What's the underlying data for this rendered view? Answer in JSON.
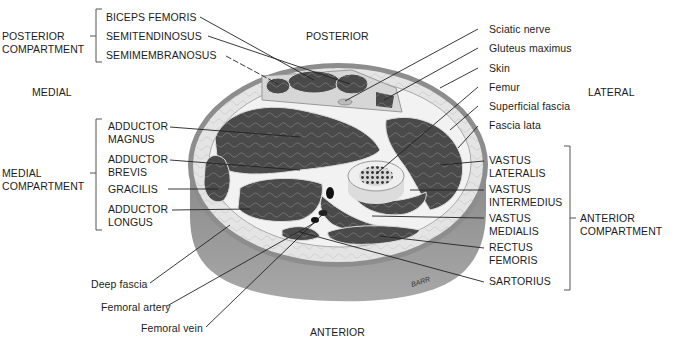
{
  "figure": {
    "orientation": {
      "posterior": "POSTERIOR",
      "anterior": "ANTERIOR",
      "medial": "MEDIAL",
      "lateral": "LATERAL"
    },
    "compartments": {
      "posterior": {
        "label": "POSTERIOR\nCOMPARTMENT",
        "muscles": [
          "BICEPS FEMORIS",
          "SEMITENDINOSUS",
          "SEMIMEMBRANOSUS"
        ]
      },
      "medial": {
        "label": "MEDIAL\nCOMPARTMENT",
        "muscles": [
          "ADDUCTOR\nMAGNUS",
          "ADDUCTOR\nBREVIS",
          "GRACILIS",
          "ADDUCTOR\nLONGUS"
        ]
      },
      "anterior": {
        "label": "ANTERIOR\nCOMPARTMENT",
        "muscles": [
          "VASTUS\nLATERALIS",
          "VASTUS\nINTERMEDIUS",
          "VASTUS\nMEDIALIS",
          "RECTUS\nFEMORIS",
          "SARTORIUS"
        ]
      }
    },
    "right_labels": [
      "Sciatic nerve",
      "Gluteus maximus",
      "Skin",
      "Femur",
      "Superficial fascia",
      "Fascia lata"
    ],
    "bottom_labels": [
      "Deep fascia",
      "Femoral artery",
      "Femoral vein"
    ],
    "signature": "BARR",
    "colors": {
      "muscle": "#4a4a4a",
      "fat": "#e2e2e2",
      "skin_band": "#8c8c8c",
      "skin_side": "#9a9a9a",
      "bone": "#eeeeee",
      "leader_line": "#222222",
      "text": "#1c1c1c"
    }
  }
}
